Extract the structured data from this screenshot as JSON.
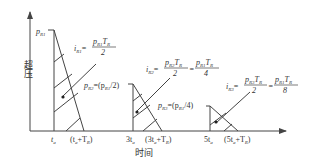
{
  "diagram": {
    "y_axis_label": "超压",
    "x_axis_label": "时间",
    "x_ticks": [
      "t",
      "(t+T)",
      "3t",
      "(3t+T)",
      "5t",
      "(5t+T)"
    ],
    "pulses": [
      {
        "peak_label": "p",
        "peak_sub": "R1",
        "impulse": {
          "i": "i",
          "i_sub": "R1",
          "eq": "=",
          "num_p": "p",
          "num_p_sub": "R1",
          "num_t": "T",
          "num_t_sub": "R",
          "den": "2"
        }
      },
      {
        "peak_label": "p",
        "peak_sub": "R2",
        "peak_eq": "=(p",
        "peak_eq_sub": "R1",
        "peak_eq_end": "/2)",
        "impulse": {
          "i": "i",
          "i_sub": "R2",
          "eq": "=",
          "num_p": "p",
          "num_p_sub": "R2",
          "num_t": "T",
          "num_t_sub": "R",
          "den": "2",
          "eq2": "=",
          "num2_p": "p",
          "num2_p_sub": "R1",
          "num2_t": "T",
          "num2_t_sub": "R",
          "den2": "4"
        }
      },
      {
        "peak_label": "p",
        "peak_sub": "R3",
        "peak_eq": "=(p",
        "peak_eq_sub": "R1",
        "peak_eq_end": "/4)",
        "impulse": {
          "i": "i",
          "i_sub": "R3",
          "eq": "=",
          "num_p": "p",
          "num_p_sub": "R3",
          "num_t": "T",
          "num_t_sub": "R",
          "den": "2",
          "eq2": "=",
          "num2_p": "p",
          "num2_p_sub": "R1",
          "num2_t": "T",
          "num2_t_sub": "R",
          "den2": "8"
        }
      }
    ],
    "tick_sub": "a",
    "tick_T_sub": "R",
    "line_color": "#444444"
  }
}
